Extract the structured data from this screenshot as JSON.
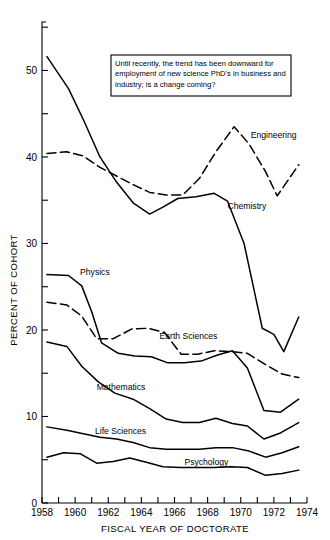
{
  "chart_data": {
    "type": "line",
    "title": "",
    "xlabel": "FISCAL YEAR OF DOCTORATE",
    "ylabel": "PERCENT OF COHORT",
    "xlim": [
      1958,
      1974
    ],
    "ylim": [
      0,
      55
    ],
    "grid": false,
    "legend_position": "inline-labels",
    "x_ticks": [
      1958,
      1959,
      1960,
      1961,
      1962,
      1963,
      1964,
      1965,
      1966,
      1967,
      1968,
      1969,
      1970,
      1971,
      1972,
      1973,
      1974
    ],
    "x_tick_labels": [
      "1958",
      "",
      "1960",
      "",
      "1962",
      "",
      "1964",
      "",
      "1966",
      "",
      "1968",
      "",
      "1970",
      "",
      "1972",
      "",
      "1974"
    ],
    "y_ticks_major": [
      0,
      10,
      20,
      30,
      40,
      50
    ],
    "y_tick_labels": [
      "0",
      "10",
      "20",
      "30",
      "40",
      "50"
    ],
    "y_ticks_minor": [
      5,
      15,
      25,
      35,
      45,
      55
    ],
    "annotation": "Until recently, the trend has been downward for employment of new science PhD's in business and industry; is a change coming?",
    "annotation_lines": [
      "Until recently, the trend has been downward for",
      "employment of new science PhD's in business and",
      "industry; is a change coming?"
    ],
    "series": [
      {
        "name": "Engineering",
        "style": "dashed",
        "label_x": 1970.6,
        "label_y": 42.2,
        "x": [
          1958.3,
          1959.5,
          1960.5,
          1961.5,
          1962.5,
          1963.5,
          1964.5,
          1965.5,
          1966.5,
          1967.5,
          1968.5,
          1969.6,
          1970.5,
          1971.5,
          1972.2,
          1973.5
        ],
        "y": [
          40.4,
          40.6,
          40.1,
          38.8,
          37.8,
          36.8,
          35.9,
          35.6,
          35.6,
          37.5,
          40.6,
          43.5,
          41.5,
          38.3,
          35.5,
          39.1
        ]
      },
      {
        "name": "Chemistry",
        "style": "solid",
        "label_x": 1969.2,
        "label_y": 34.0,
        "x": [
          1958.3,
          1959.6,
          1960.5,
          1961.5,
          1962.5,
          1963.5,
          1964.5,
          1965.3,
          1966.2,
          1967.3,
          1968.4,
          1969.2,
          1970.2,
          1971.3,
          1972.0,
          1972.6,
          1973.5
        ],
        "y": [
          51.6,
          47.9,
          44.3,
          40.0,
          37.1,
          34.7,
          33.4,
          34.2,
          35.2,
          35.4,
          35.8,
          34.9,
          30.0,
          20.2,
          19.5,
          17.5,
          21.5
        ]
      },
      {
        "name": "Physics",
        "style": "solid",
        "label_x": 1960.3,
        "label_y": 26.3,
        "x": [
          1958.3,
          1959.6,
          1960.4,
          1961.0,
          1961.6,
          1962.6,
          1963.6,
          1964.6,
          1965.6,
          1966.6,
          1967.6,
          1968.6,
          1969.5,
          1970.4,
          1971.4,
          1972.4,
          1973.5
        ],
        "y": [
          26.4,
          26.3,
          25.1,
          22.1,
          18.5,
          17.3,
          17.0,
          16.9,
          16.2,
          16.2,
          16.4,
          17.1,
          17.6,
          15.6,
          10.7,
          10.5,
          12.0
        ]
      },
      {
        "name": "Earth Sciences",
        "style": "dashed",
        "label_x": 1965.1,
        "label_y": 18.9,
        "x": [
          1958.3,
          1959.5,
          1960.4,
          1961.3,
          1962.3,
          1963.4,
          1964.4,
          1965.4,
          1966.4,
          1967.4,
          1968.4,
          1969.4,
          1970.4,
          1971.4,
          1972.5,
          1973.5
        ],
        "y": [
          23.2,
          22.9,
          21.6,
          19.0,
          19.0,
          20.1,
          20.2,
          19.7,
          17.2,
          17.2,
          17.6,
          17.5,
          17.3,
          16.1,
          14.9,
          14.5
        ]
      },
      {
        "name": "Mathematics",
        "style": "solid",
        "label_x": 1961.3,
        "label_y": 13.1,
        "x": [
          1958.3,
          1959.5,
          1960.4,
          1961.4,
          1962.4,
          1963.5,
          1964.5,
          1965.5,
          1966.5,
          1967.5,
          1968.5,
          1969.5,
          1970.4,
          1971.4,
          1972.4,
          1973.5
        ],
        "y": [
          18.6,
          18.1,
          15.8,
          14.0,
          12.7,
          12.0,
          10.9,
          9.7,
          9.3,
          9.3,
          9.8,
          9.2,
          8.9,
          7.4,
          8.1,
          9.3
        ]
      },
      {
        "name": "Life Sciences",
        "style": "solid",
        "label_x": 1961.2,
        "label_y": 8.0,
        "x": [
          1958.3,
          1959.5,
          1960.5,
          1961.5,
          1962.5,
          1963.5,
          1964.5,
          1965.5,
          1966.5,
          1967.5,
          1968.5,
          1969.5,
          1970.5,
          1971.5,
          1972.5,
          1973.5
        ],
        "y": [
          8.8,
          8.4,
          8.0,
          7.6,
          7.4,
          7.0,
          6.4,
          6.2,
          6.2,
          6.2,
          6.4,
          6.4,
          6.0,
          5.3,
          5.8,
          6.5
        ]
      },
      {
        "name": "Psychology",
        "style": "solid",
        "label_x": 1966.6,
        "label_y": 4.4,
        "x": [
          1958.3,
          1959.3,
          1960.3,
          1961.3,
          1962.3,
          1963.3,
          1964.3,
          1965.3,
          1966.4,
          1967.4,
          1968.4,
          1969.4,
          1970.4,
          1971.5,
          1972.5,
          1973.5
        ],
        "y": [
          5.3,
          5.8,
          5.7,
          4.6,
          4.8,
          5.2,
          4.7,
          4.2,
          4.1,
          4.1,
          4.1,
          4.2,
          4.1,
          3.2,
          3.4,
          3.8
        ]
      }
    ]
  }
}
